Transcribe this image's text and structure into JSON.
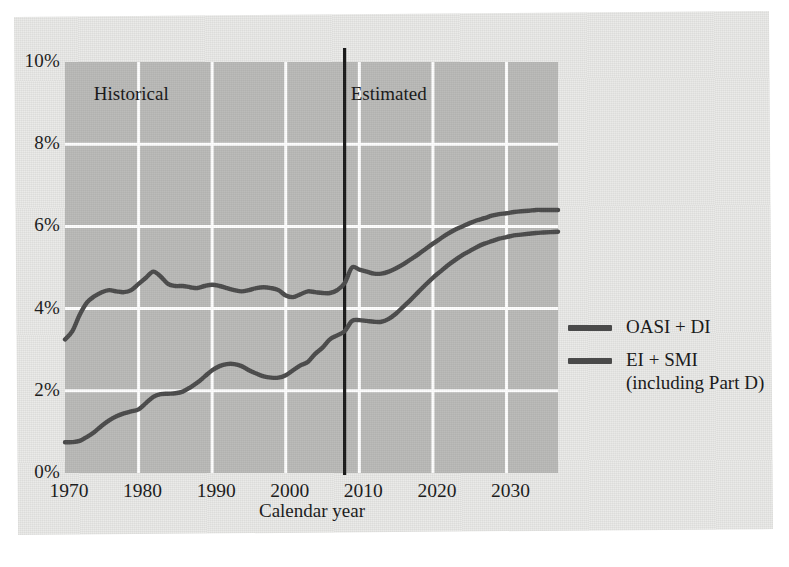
{
  "figure": {
    "background_color": "#e9e9e7",
    "plot_background_color": "#b9b9b7",
    "gridline_color": "#ffffff",
    "series_color": "#4a4a4a",
    "divider_color": "#1a1a1a"
  },
  "axis": {
    "x_title": "Calendar year",
    "x_ticks": [
      "1970",
      "1980",
      "1990",
      "2000",
      "2010",
      "2020",
      "2030"
    ],
    "y_ticks": [
      "0%",
      "2%",
      "4%",
      "6%",
      "8%",
      "10%"
    ]
  },
  "annotations": {
    "historical": "Historical",
    "estimated": "Estimated",
    "divider_year": 2008
  },
  "legend": {
    "entries": [
      {
        "label": "OASI + DI",
        "sublabel": "",
        "color": "#4a4a4a"
      },
      {
        "label": "EI + SMI",
        "sublabel": "(including Part D)",
        "color": "#4a4a4a"
      }
    ]
  },
  "chart_data": {
    "type": "line",
    "title": "",
    "xlabel": "Calendar year",
    "ylabel": "",
    "xlim": [
      1970,
      2037
    ],
    "ylim": [
      0,
      10
    ],
    "grid": true,
    "legend_position": "right",
    "y_tick_values": [
      0,
      2,
      4,
      6,
      8,
      10
    ],
    "x_tick_values": [
      1970,
      1980,
      1990,
      2000,
      2010,
      2020,
      2030
    ],
    "annotations": [
      {
        "text": "Historical",
        "x": 1979,
        "y": 9.2
      },
      {
        "text": "Estimated",
        "x": 2014,
        "y": 9.2
      },
      {
        "type": "vline",
        "x": 2008
      }
    ],
    "series": [
      {
        "name": "OASI + DI",
        "color": "#4a4a4a",
        "x": [
          1970,
          1971,
          1972,
          1973,
          1974,
          1975,
          1976,
          1977,
          1978,
          1979,
          1980,
          1981,
          1982,
          1983,
          1984,
          1985,
          1986,
          1987,
          1988,
          1989,
          1990,
          1991,
          1992,
          1993,
          1994,
          1995,
          1996,
          1997,
          1998,
          1999,
          2000,
          2001,
          2002,
          2003,
          2004,
          2005,
          2006,
          2007,
          2008,
          2009,
          2010,
          2011,
          2012,
          2013,
          2014,
          2015,
          2016,
          2017,
          2018,
          2019,
          2020,
          2021,
          2022,
          2023,
          2024,
          2025,
          2026,
          2027,
          2028,
          2029,
          2030,
          2031,
          2032,
          2033,
          2034,
          2035,
          2036,
          2037
        ],
        "y": [
          3.25,
          3.45,
          3.85,
          4.15,
          4.3,
          4.4,
          4.45,
          4.42,
          4.4,
          4.45,
          4.6,
          4.75,
          4.9,
          4.78,
          4.6,
          4.55,
          4.55,
          4.52,
          4.5,
          4.55,
          4.58,
          4.55,
          4.5,
          4.45,
          4.42,
          4.45,
          4.5,
          4.52,
          4.5,
          4.45,
          4.32,
          4.28,
          4.35,
          4.42,
          4.4,
          4.38,
          4.38,
          4.45,
          4.62,
          5.0,
          4.95,
          4.9,
          4.85,
          4.85,
          4.9,
          4.98,
          5.08,
          5.2,
          5.32,
          5.45,
          5.58,
          5.7,
          5.82,
          5.92,
          6.0,
          6.08,
          6.15,
          6.2,
          6.26,
          6.3,
          6.32,
          6.35,
          6.37,
          6.38,
          6.4,
          6.4,
          6.4,
          6.4
        ]
      },
      {
        "name": "EI + SMI (including Part D)",
        "color": "#4a4a4a",
        "x": [
          1970,
          1971,
          1972,
          1973,
          1974,
          1975,
          1976,
          1977,
          1978,
          1979,
          1980,
          1981,
          1982,
          1983,
          1984,
          1985,
          1986,
          1987,
          1988,
          1989,
          1990,
          1991,
          1992,
          1993,
          1994,
          1995,
          1996,
          1997,
          1998,
          1999,
          2000,
          2001,
          2002,
          2003,
          2004,
          2005,
          2006,
          2007,
          2008,
          2009,
          2010,
          2011,
          2012,
          2013,
          2014,
          2015,
          2016,
          2017,
          2018,
          2019,
          2020,
          2021,
          2022,
          2023,
          2024,
          2025,
          2026,
          2027,
          2028,
          2029,
          2030,
          2031,
          2032,
          2033,
          2034,
          2035,
          2036,
          2037
        ],
        "y": [
          0.75,
          0.75,
          0.78,
          0.88,
          1.0,
          1.15,
          1.28,
          1.38,
          1.45,
          1.5,
          1.55,
          1.7,
          1.85,
          1.92,
          1.93,
          1.94,
          1.98,
          2.08,
          2.2,
          2.35,
          2.5,
          2.6,
          2.65,
          2.65,
          2.6,
          2.5,
          2.42,
          2.35,
          2.32,
          2.32,
          2.38,
          2.5,
          2.62,
          2.7,
          2.9,
          3.05,
          3.25,
          3.35,
          3.45,
          3.7,
          3.72,
          3.7,
          3.68,
          3.68,
          3.75,
          3.88,
          4.05,
          4.22,
          4.4,
          4.58,
          4.75,
          4.9,
          5.05,
          5.18,
          5.3,
          5.4,
          5.5,
          5.58,
          5.64,
          5.7,
          5.74,
          5.78,
          5.8,
          5.82,
          5.84,
          5.85,
          5.86,
          5.87
        ]
      }
    ]
  }
}
